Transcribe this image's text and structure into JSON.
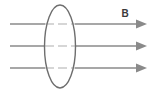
{
  "figure": {
    "background_color": "#ffffff",
    "canvas": {
      "width": 158,
      "height": 93
    }
  },
  "labels": {
    "field_label": "B",
    "field_label_position": {
      "x": 125,
      "y": 17
    }
  },
  "colors": {
    "field_line": "#8a8a8a",
    "field_line_hidden": "#c9c9c9",
    "loop_outline": "#6e6e6e",
    "label_text": "#3a3a3a",
    "arrowhead": "#8a8a8a"
  },
  "loop": {
    "name": "loop-ellipse",
    "center_x": 60,
    "center_y": 46.5,
    "radius_x": 15.5,
    "radius_y": 41.5,
    "stroke_width": 1.4
  },
  "field_lines": [
    {
      "name": "field-line-top",
      "y": 24,
      "x_start": 10,
      "x_end": 147,
      "arrow": true,
      "hidden_span": {
        "x_start": 44.5,
        "x_end": 75.5
      }
    },
    {
      "name": "field-line-middle",
      "y": 46,
      "x_start": 10,
      "x_end": 147,
      "arrow": true,
      "hidden_span": {
        "x_start": 44.5,
        "x_end": 75.5
      }
    },
    {
      "name": "field-line-bottom",
      "y": 68,
      "x_start": 10,
      "x_end": 147,
      "arrow": true,
      "hidden_span": {
        "x_start": 44.5,
        "x_end": 75.5
      }
    }
  ],
  "arrowhead": {
    "length": 11,
    "half_width": 4.5
  }
}
